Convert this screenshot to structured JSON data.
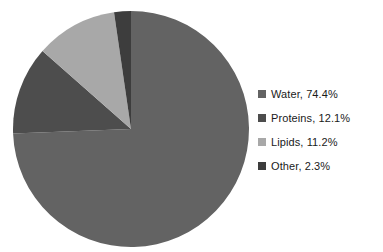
{
  "clipped_title": "",
  "chart_data": {
    "type": "pie",
    "title": "",
    "labels": [
      "Water",
      "Proteins",
      "Lipids",
      "Other"
    ],
    "values": [
      74.4,
      12.1,
      11.2,
      2.3
    ],
    "value_suffix": "%",
    "colors": [
      "#636363",
      "#4d4d4d",
      "#a8a8a8",
      "#3d3d3d"
    ],
    "start_angle_deg": 0,
    "direction": "clockwise",
    "legend_position": "right",
    "grid": false,
    "legend_entries": [
      {
        "label": "Water",
        "value": 74.4,
        "text": "Water, 74.4%",
        "color": "#636363",
        "icon": "square-swatch"
      },
      {
        "label": "Proteins",
        "value": 12.1,
        "text": "Proteins, 12.1%",
        "color": "#4d4d4d",
        "icon": "square-swatch"
      },
      {
        "label": "Lipids",
        "value": 11.2,
        "text": "Lipids, 11.2%",
        "color": "#a8a8a8",
        "icon": "square-swatch"
      },
      {
        "label": "Other",
        "value": 2.3,
        "text": "Other, 2.3%",
        "color": "#3d3d3d",
        "icon": "square-swatch"
      }
    ]
  }
}
